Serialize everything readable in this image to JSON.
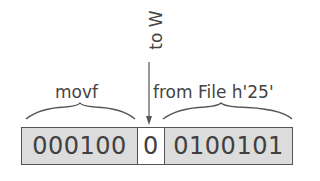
{
  "diagram": {
    "annotation_top": "to W",
    "brace_left_label": "movf",
    "brace_right_label": "from File h'25'",
    "fields": [
      {
        "value": "000100",
        "shaded": true
      },
      {
        "value": "0",
        "shaded": false
      },
      {
        "value": "0100101",
        "shaded": true
      }
    ],
    "colors": {
      "field_fill": "#dcdcdc",
      "border": "#555555",
      "text": "#404040"
    }
  }
}
